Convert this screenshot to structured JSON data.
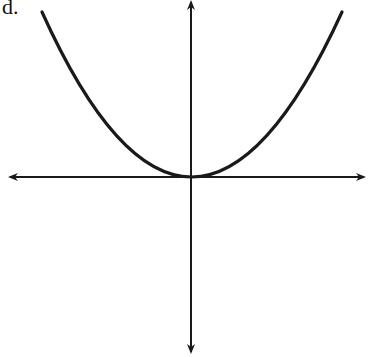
{
  "figure": {
    "label": "d.",
    "curve": {
      "equation": "y = x^2",
      "vertex": [
        0,
        0
      ],
      "opens": "up"
    },
    "axes": {
      "x_arrows": "both ends",
      "y_arrows": "both ends",
      "tick_marks": false
    },
    "colors": {
      "stroke": "#1a1a1a",
      "background": "#ffffff"
    }
  }
}
